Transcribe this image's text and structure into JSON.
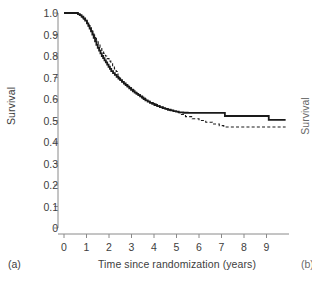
{
  "figure": {
    "panel_label": "(a)",
    "adjacent_panel_label": "(b)",
    "adjacent_panel_ylabel": "Survival"
  },
  "chart_data": {
    "type": "line",
    "subtype": "kaplan-meier-step",
    "title": "",
    "xlabel": "Time since randomization (years)",
    "ylabel": "Survival",
    "xlim": [
      0,
      10
    ],
    "ylim": [
      0,
      1.0
    ],
    "xticks": [
      0,
      1,
      2,
      3,
      4,
      5,
      6,
      7,
      8,
      9
    ],
    "xtick_labels": [
      "0",
      "1",
      "2",
      "3",
      "4",
      "5",
      "6",
      "7",
      "8",
      "9"
    ],
    "yticks": [
      0,
      0.1,
      0.2,
      0.3,
      0.4,
      0.5,
      0.6,
      0.7,
      0.8,
      0.9,
      1.0
    ],
    "ytick_labels": [
      "0",
      "0.1",
      "0.2",
      "0.3",
      "0.4",
      "0.5",
      "0.6",
      "0.7",
      "0.8",
      "0.9",
      "1.0"
    ],
    "grid": false,
    "legend": false,
    "line_color": "#1a1a1a",
    "series": [
      {
        "name": "solid-curve",
        "style": "solid",
        "x": [
          0.0,
          0.55,
          0.62,
          0.7,
          0.78,
          0.86,
          0.94,
          1.02,
          1.08,
          1.14,
          1.2,
          1.26,
          1.32,
          1.38,
          1.44,
          1.5,
          1.56,
          1.62,
          1.68,
          1.74,
          1.8,
          1.86,
          1.92,
          1.98,
          2.04,
          2.1,
          2.18,
          2.26,
          2.34,
          2.42,
          2.5,
          2.58,
          2.66,
          2.74,
          2.82,
          2.9,
          2.98,
          3.06,
          3.14,
          3.22,
          3.3,
          3.38,
          3.46,
          3.54,
          3.62,
          3.72,
          3.82,
          3.92,
          4.02,
          4.14,
          4.26,
          4.38,
          4.5,
          4.62,
          4.74,
          4.86,
          4.98,
          5.1,
          5.3,
          5.5,
          7.15,
          9.1,
          9.85
        ],
        "y": [
          1.0,
          1.0,
          0.995,
          0.99,
          0.983,
          0.975,
          0.965,
          0.952,
          0.94,
          0.928,
          0.915,
          0.9,
          0.884,
          0.868,
          0.852,
          0.838,
          0.825,
          0.812,
          0.8,
          0.79,
          0.78,
          0.77,
          0.76,
          0.75,
          0.74,
          0.73,
          0.72,
          0.712,
          0.703,
          0.695,
          0.688,
          0.68,
          0.672,
          0.665,
          0.658,
          0.65,
          0.643,
          0.636,
          0.63,
          0.624,
          0.618,
          0.612,
          0.606,
          0.6,
          0.594,
          0.588,
          0.582,
          0.577,
          0.572,
          0.567,
          0.562,
          0.558,
          0.554,
          0.55,
          0.547,
          0.544,
          0.541,
          0.538,
          0.536,
          0.535,
          0.521,
          0.503,
          0.503
        ]
      },
      {
        "name": "dashed-curve",
        "style": "dashed",
        "x": [
          0.0,
          0.55,
          0.64,
          0.72,
          0.8,
          0.88,
          0.96,
          1.04,
          1.12,
          1.2,
          1.28,
          1.36,
          1.44,
          1.52,
          1.6,
          1.68,
          1.76,
          1.84,
          1.92,
          2.0,
          2.08,
          2.16,
          2.24,
          2.32,
          2.4,
          2.48,
          2.56,
          2.64,
          2.72,
          2.8,
          2.9,
          3.0,
          3.1,
          3.2,
          3.3,
          3.4,
          3.5,
          3.62,
          3.74,
          3.86,
          3.98,
          4.1,
          4.25,
          4.4,
          4.55,
          4.7,
          4.85,
          5.0,
          5.15,
          5.4,
          5.7,
          6.0,
          6.3,
          6.6,
          6.9,
          7.1,
          9.85
        ],
        "y": [
          1.0,
          1.0,
          0.994,
          0.988,
          0.98,
          0.97,
          0.958,
          0.945,
          0.932,
          0.918,
          0.902,
          0.886,
          0.87,
          0.854,
          0.84,
          0.826,
          0.812,
          0.8,
          0.788,
          0.776,
          0.764,
          0.752,
          0.74,
          0.728,
          0.7,
          0.69,
          0.68,
          0.672,
          0.666,
          0.66,
          0.652,
          0.644,
          0.636,
          0.628,
          0.62,
          0.612,
          0.604,
          0.596,
          0.589,
          0.582,
          0.576,
          0.57,
          0.564,
          0.558,
          0.552,
          0.547,
          0.542,
          0.537,
          0.528,
          0.518,
          0.508,
          0.5,
          0.492,
          0.484,
          0.476,
          0.47,
          0.47
        ]
      }
    ]
  }
}
